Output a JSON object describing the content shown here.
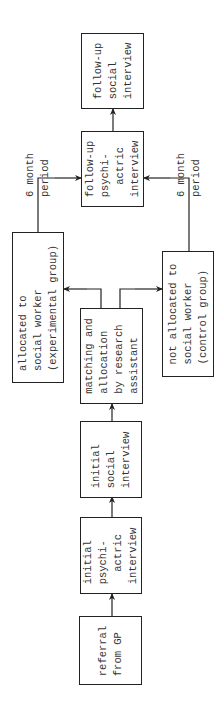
{
  "diagram": {
    "type": "flowchart",
    "orientation": "rotated-90-ccw",
    "nodes": {
      "referral": "referral\nfrom GP",
      "initial_psych": "initial\npsychi-\n  actric\ninterview",
      "initial_social": "initial\nsocial\ninterview",
      "matching": "matching and\nallocation\nby research\nassistant",
      "experimental": "allocated to\nsocial worker\n(experimental group)",
      "control": "not allocated to\nsocial worker\n(control group)",
      "followup_psych": "follow-up\npsychi-\n  actric\ninterview",
      "followup_social": "follow-up\nsocial\ninterview"
    },
    "notes": {
      "top_period": "6 month\nperiod",
      "bottom_period": "6 month\nperiod"
    },
    "edges": [
      [
        "referral",
        "initial_psych"
      ],
      [
        "initial_psych",
        "initial_social"
      ],
      [
        "initial_social",
        "matching"
      ],
      [
        "matching",
        "experimental"
      ],
      [
        "matching",
        "control"
      ],
      [
        "experimental",
        "followup_psych"
      ],
      [
        "control",
        "followup_psych"
      ],
      [
        "followup_psych",
        "followup_social"
      ]
    ],
    "colors": {
      "line": "#222222",
      "text": "#333333",
      "background": "#ffffff"
    }
  }
}
